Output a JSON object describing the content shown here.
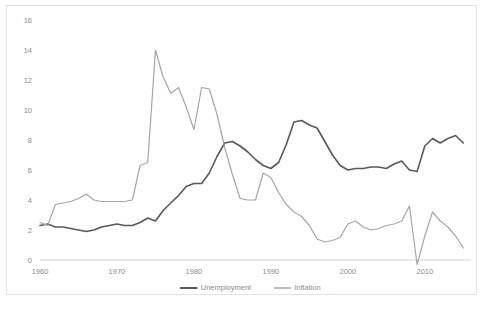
{
  "chart_data": {
    "type": "line",
    "title": "",
    "xlabel": "",
    "ylabel": "",
    "xlim": [
      1960,
      2016
    ],
    "ylim": [
      0,
      16
    ],
    "ytick_step": 2,
    "yticks": [
      0,
      2,
      4,
      6,
      8,
      10,
      12,
      14,
      16
    ],
    "xticks": [
      1960,
      1970,
      1980,
      1990,
      2000,
      2010
    ],
    "grid": false,
    "legend_position": "bottom",
    "x": [
      1960,
      1961,
      1962,
      1963,
      1964,
      1965,
      1966,
      1967,
      1968,
      1969,
      1970,
      1971,
      1972,
      1973,
      1974,
      1975,
      1976,
      1977,
      1978,
      1979,
      1980,
      1981,
      1982,
      1983,
      1984,
      1985,
      1986,
      1987,
      1988,
      1989,
      1990,
      1991,
      1992,
      1993,
      1994,
      1995,
      1996,
      1997,
      1998,
      1999,
      2000,
      2001,
      2002,
      2003,
      2004,
      2005,
      2006,
      2007,
      2008,
      2009,
      2010,
      2011,
      2012,
      2013,
      2014,
      2015
    ],
    "series": [
      {
        "name": "Unemployment",
        "color": "#595959",
        "width": 1.6,
        "values": [
          2.3,
          2.4,
          2.2,
          2.2,
          2.1,
          2.0,
          1.9,
          2.0,
          2.2,
          2.3,
          2.4,
          2.3,
          2.3,
          2.5,
          2.8,
          2.6,
          3.3,
          3.8,
          4.3,
          4.9,
          5.1,
          5.1,
          5.8,
          6.9,
          7.8,
          7.9,
          7.6,
          7.2,
          6.7,
          6.3,
          6.1,
          6.5,
          7.7,
          9.2,
          9.3,
          9.0,
          8.8,
          7.9,
          7.0,
          6.3,
          6.0,
          6.1,
          6.1,
          6.2,
          6.2,
          6.1,
          6.4,
          6.6,
          6.0,
          5.9,
          7.6,
          8.1,
          7.8,
          8.1,
          8.3,
          7.8
        ]
      },
      {
        "name": "Inflation",
        "color": "#a6a6a6",
        "width": 1.2,
        "values": [
          2.5,
          2.3,
          3.7,
          3.8,
          3.9,
          4.1,
          4.4,
          4.0,
          3.9,
          3.9,
          3.9,
          3.9,
          4.0,
          6.3,
          6.5,
          14.0,
          12.2,
          11.1,
          11.5,
          10.2,
          8.7,
          11.5,
          11.4,
          9.7,
          7.5,
          5.7,
          4.1,
          4.0,
          4.0,
          5.8,
          5.5,
          4.5,
          3.7,
          3.2,
          2.9,
          2.3,
          1.4,
          1.2,
          1.3,
          1.5,
          2.4,
          2.6,
          2.2,
          2.0,
          2.1,
          2.3,
          2.4,
          2.6,
          3.6,
          -0.3,
          1.6,
          3.2,
          2.6,
          2.2,
          1.6,
          0.8
        ]
      }
    ]
  },
  "legend": {
    "items": [
      {
        "label": "Unemployment",
        "color": "#595959"
      },
      {
        "label": "Inflation",
        "color": "#a6a6a6"
      }
    ]
  }
}
